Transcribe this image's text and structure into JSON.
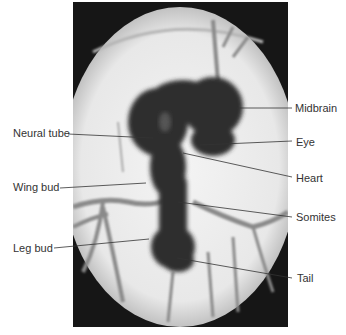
{
  "figure": {
    "labels_left": [
      {
        "id": "neural-tube",
        "text": "Neural tube"
      },
      {
        "id": "wing-bud",
        "text": "Wing bud"
      },
      {
        "id": "leg-bud",
        "text": "Leg bud"
      }
    ],
    "labels_right": [
      {
        "id": "midbrain",
        "text": "Midbrain"
      },
      {
        "id": "eye",
        "text": "Eye"
      },
      {
        "id": "heart",
        "text": "Heart"
      },
      {
        "id": "somites",
        "text": "Somites"
      },
      {
        "id": "tail",
        "text": "Tail"
      }
    ],
    "colors": {
      "background": "#ffffff",
      "label_text": "#333333",
      "leader_line": "#333333",
      "embryo": "#2e2e2e",
      "vessel": "#7a7a7a",
      "vignette": "#111111"
    }
  }
}
